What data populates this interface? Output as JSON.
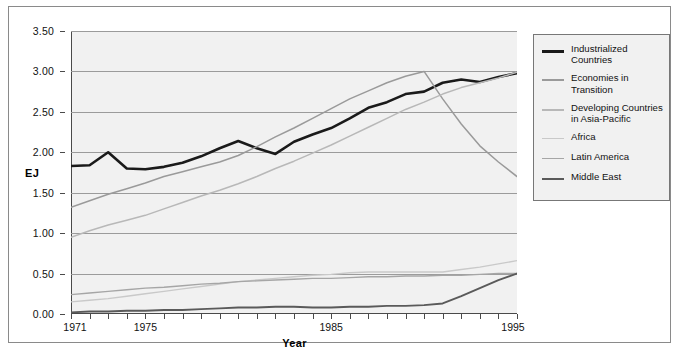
{
  "chart_data": {
    "type": "line",
    "title": "",
    "xlabel": "Year",
    "ylabel": "EJ",
    "xlim": [
      1971,
      1995
    ],
    "ylim": [
      0.0,
      3.5
    ],
    "grid": "horizontal",
    "legend_position": "right",
    "x": [
      1971,
      1972,
      1973,
      1974,
      1975,
      1976,
      1977,
      1978,
      1979,
      1980,
      1981,
      1982,
      1983,
      1984,
      1985,
      1986,
      1987,
      1988,
      1989,
      1990,
      1991,
      1992,
      1993,
      1994,
      1995
    ],
    "ytick_labels": [
      "0.00",
      "0.50",
      "1.00",
      "1.50",
      "2.00",
      "2.50",
      "3.00",
      "3.50"
    ],
    "ytick_values": [
      0.0,
      0.5,
      1.0,
      1.5,
      2.0,
      2.5,
      3.0,
      3.5
    ],
    "xtick_labels": [
      "1971",
      "1975",
      "1985",
      "1995"
    ],
    "xtick_values": [
      1971,
      1975,
      1985,
      1995
    ],
    "series": [
      {
        "name": "Industrialized Countries",
        "color": "#1a1a1a",
        "width": 2.6,
        "values": [
          1.83,
          1.84,
          2.0,
          1.8,
          1.79,
          1.82,
          1.87,
          1.95,
          2.05,
          2.14,
          2.05,
          1.98,
          2.13,
          2.22,
          2.3,
          2.42,
          2.55,
          2.62,
          2.72,
          2.75,
          2.86,
          2.9,
          2.87,
          2.93,
          2.98
        ]
      },
      {
        "name": "Economies in Transition",
        "color": "#9a9a9a",
        "width": 1.5,
        "values": [
          1.32,
          1.4,
          1.48,
          1.55,
          1.62,
          1.7,
          1.76,
          1.82,
          1.88,
          1.96,
          2.07,
          2.19,
          2.3,
          2.42,
          2.54,
          2.66,
          2.76,
          2.86,
          2.94,
          3.0,
          2.66,
          2.35,
          2.08,
          1.88,
          1.7
        ]
      },
      {
        "name": "Developing Countries\nin Asia-Pacific",
        "color": "#b8b8b8",
        "width": 1.5,
        "values": [
          0.95,
          1.03,
          1.1,
          1.16,
          1.22,
          1.3,
          1.38,
          1.46,
          1.53,
          1.61,
          1.7,
          1.8,
          1.89,
          1.99,
          2.09,
          2.2,
          2.31,
          2.42,
          2.53,
          2.62,
          2.72,
          2.8,
          2.86,
          2.92,
          2.99
        ]
      },
      {
        "name": "Africa",
        "color": "#c9c9c9",
        "width": 1.4,
        "values": [
          0.15,
          0.17,
          0.19,
          0.22,
          0.25,
          0.28,
          0.31,
          0.34,
          0.37,
          0.4,
          0.42,
          0.44,
          0.46,
          0.48,
          0.49,
          0.51,
          0.52,
          0.52,
          0.52,
          0.52,
          0.52,
          0.55,
          0.58,
          0.62,
          0.66
        ]
      },
      {
        "name": "Latin America",
        "color": "#a6a6a6",
        "width": 1.4,
        "values": [
          0.24,
          0.26,
          0.28,
          0.3,
          0.32,
          0.33,
          0.35,
          0.37,
          0.38,
          0.4,
          0.41,
          0.42,
          0.43,
          0.44,
          0.44,
          0.45,
          0.46,
          0.46,
          0.47,
          0.47,
          0.48,
          0.48,
          0.49,
          0.5,
          0.5
        ]
      },
      {
        "name": "Middle East",
        "color": "#5a5a5a",
        "width": 1.9,
        "values": [
          0.02,
          0.03,
          0.03,
          0.04,
          0.04,
          0.05,
          0.05,
          0.06,
          0.07,
          0.08,
          0.08,
          0.09,
          0.09,
          0.08,
          0.08,
          0.09,
          0.09,
          0.1,
          0.1,
          0.11,
          0.13,
          0.22,
          0.32,
          0.42,
          0.5
        ]
      }
    ]
  },
  "legend": {
    "items": [
      {
        "label": "Industrialized Countries"
      },
      {
        "label": "Economies in Transition"
      },
      {
        "label": "Developing Countries\nin Asia-Pacific"
      },
      {
        "label": "Africa"
      },
      {
        "label": "Latin America"
      },
      {
        "label": "Middle East"
      }
    ]
  },
  "axes": {
    "y_title": "EJ",
    "x_title": "Year"
  }
}
